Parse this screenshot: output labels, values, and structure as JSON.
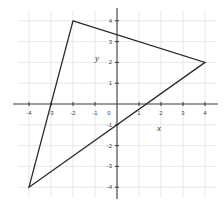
{
  "chart_data": {
    "type": "line",
    "title": "",
    "xlabel": "x",
    "ylabel": "y",
    "xlim": [
      -4.5,
      4.5
    ],
    "ylim": [
      -4.5,
      4.5
    ],
    "grid": true,
    "x_ticks": [
      -4,
      -3,
      -2,
      -1,
      0,
      1,
      2,
      3,
      4
    ],
    "y_ticks": [
      -4,
      -3,
      -2,
      -1,
      1,
      2,
      3,
      4
    ],
    "x_tick_labels": [
      "-4",
      "-3",
      "-2",
      "-1",
      "0",
      "1",
      "2",
      "3",
      "4"
    ],
    "y_tick_labels": [
      "-4",
      "-3",
      "-2",
      "-1",
      "1",
      "2",
      "3",
      "4"
    ],
    "series": [
      {
        "name": "triangle",
        "closed": true,
        "points": [
          {
            "x": -2,
            "y": 4
          },
          {
            "x": 4,
            "y": 2
          },
          {
            "x": -4,
            "y": -4
          }
        ]
      }
    ],
    "intercepts": {
      "y_axis": [
        3.33,
        -1
      ],
      "x_axis": [
        -3,
        1.33
      ]
    }
  },
  "labels": {
    "x_axis": "x",
    "y_axis": "y"
  },
  "colors": {
    "grid": "#d9d9d9",
    "axis": "#3a3a3a",
    "shape": "#2b2b2b",
    "background": "#ffffff"
  }
}
